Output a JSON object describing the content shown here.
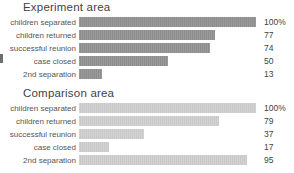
{
  "chart_data": [
    {
      "type": "bar",
      "title": "Experiment area",
      "orientation": "horizontal",
      "categories": [
        "children separated",
        "children returned",
        "successful reunion",
        "case closed",
        "2nd separation"
      ],
      "values": [
        100,
        77,
        74,
        50,
        13
      ],
      "value_labels": [
        "100%",
        "77",
        "74",
        "50",
        "13"
      ],
      "xlabel": "",
      "ylabel": "",
      "xlim": [
        0,
        100
      ],
      "grid": false,
      "legend": "none",
      "bar_color": "#8c8c8c"
    },
    {
      "type": "bar",
      "title": "Comparison area",
      "orientation": "horizontal",
      "categories": [
        "children separated",
        "children returned",
        "successful reunion",
        "case closed",
        "2nd separation"
      ],
      "values": [
        100,
        79,
        37,
        17,
        95
      ],
      "value_labels": [
        "100%",
        "79",
        "37",
        "17",
        "95"
      ],
      "xlabel": "",
      "ylabel": "",
      "xlim": [
        0,
        100
      ],
      "grid": false,
      "legend": "none",
      "bar_color": "#c9c9c9"
    }
  ]
}
